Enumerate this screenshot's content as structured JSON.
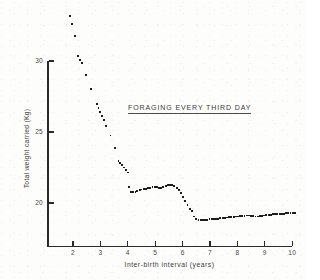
{
  "chart_data": {
    "type": "scatter",
    "title": "",
    "annotation": "FORAGING EVERY THIRD DAY",
    "xlabel": "Inter-birth interval (years)",
    "ylabel": "Total weight carried (Kg)",
    "xlim": [
      1.1,
      10.2
    ],
    "ylim": [
      16.4,
      33.9
    ],
    "xticks": [
      2,
      3,
      4,
      5,
      6,
      7,
      8,
      9,
      10
    ],
    "yticks": [
      30,
      25,
      20
    ],
    "xtick_labels": [
      "2",
      "3",
      "4",
      "5",
      "6",
      "7",
      "8",
      "9",
      "10"
    ],
    "ytick_labels": [
      "30",
      "25",
      "20"
    ],
    "grid": false,
    "legend": false,
    "marker": "square",
    "marker_color": "#1d1d1d",
    "points": [
      [
        1.88,
        33.15
      ],
      [
        1.95,
        32.6
      ],
      [
        2.06,
        31.75
      ],
      [
        2.18,
        30.35
      ],
      [
        2.26,
        30.05
      ],
      [
        2.33,
        29.85
      ],
      [
        2.48,
        29.0
      ],
      [
        2.66,
        28.05
      ],
      [
        2.86,
        26.95
      ],
      [
        2.93,
        26.7
      ],
      [
        3.0,
        26.4
      ],
      [
        3.06,
        26.1
      ],
      [
        3.13,
        25.85
      ],
      [
        3.22,
        25.45
      ],
      [
        3.37,
        24.75
      ],
      [
        3.54,
        23.85
      ],
      [
        3.66,
        22.95
      ],
      [
        3.73,
        22.8
      ],
      [
        3.8,
        22.65
      ],
      [
        3.86,
        22.5
      ],
      [
        3.93,
        22.3
      ],
      [
        4.0,
        22.15
      ],
      [
        4.06,
        21.1
      ],
      [
        4.13,
        20.8
      ],
      [
        4.2,
        20.75
      ],
      [
        4.28,
        20.8
      ],
      [
        4.35,
        20.85
      ],
      [
        4.43,
        20.9
      ],
      [
        4.5,
        20.95
      ],
      [
        4.58,
        21.0
      ],
      [
        4.66,
        21.0
      ],
      [
        4.74,
        21.05
      ],
      [
        4.82,
        21.05
      ],
      [
        4.9,
        21.1
      ],
      [
        4.98,
        21.15
      ],
      [
        5.06,
        21.1
      ],
      [
        5.14,
        21.05
      ],
      [
        5.22,
        21.05
      ],
      [
        5.3,
        21.1
      ],
      [
        5.38,
        21.2
      ],
      [
        5.46,
        21.25
      ],
      [
        5.54,
        21.25
      ],
      [
        5.62,
        21.25
      ],
      [
        5.7,
        21.2
      ],
      [
        5.78,
        21.05
      ],
      [
        5.86,
        20.9
      ],
      [
        5.94,
        20.7
      ],
      [
        6.02,
        20.45
      ],
      [
        6.1,
        20.15
      ],
      [
        6.18,
        19.85
      ],
      [
        6.26,
        19.6
      ],
      [
        6.34,
        19.45
      ],
      [
        6.42,
        19.05
      ],
      [
        6.5,
        18.85
      ],
      [
        6.58,
        18.8
      ],
      [
        6.66,
        18.78
      ],
      [
        6.74,
        18.78
      ],
      [
        6.82,
        18.8
      ],
      [
        6.9,
        18.82
      ],
      [
        6.98,
        18.85
      ],
      [
        7.06,
        18.85
      ],
      [
        7.14,
        18.88
      ],
      [
        7.22,
        18.9
      ],
      [
        7.3,
        18.9
      ],
      [
        7.38,
        18.92
      ],
      [
        7.46,
        18.95
      ],
      [
        7.54,
        18.95
      ],
      [
        7.62,
        18.98
      ],
      [
        7.7,
        19.0
      ],
      [
        7.78,
        19.0
      ],
      [
        7.86,
        19.02
      ],
      [
        7.94,
        19.05
      ],
      [
        8.02,
        19.05
      ],
      [
        8.1,
        19.08
      ],
      [
        8.18,
        19.1
      ],
      [
        8.26,
        19.1
      ],
      [
        8.34,
        19.12
      ],
      [
        8.42,
        19.12
      ],
      [
        8.5,
        19.1
      ],
      [
        8.58,
        19.08
      ],
      [
        8.66,
        19.05
      ],
      [
        8.74,
        19.05
      ],
      [
        8.82,
        19.08
      ],
      [
        8.9,
        19.1
      ],
      [
        8.98,
        19.12
      ],
      [
        9.06,
        19.15
      ],
      [
        9.14,
        19.15
      ],
      [
        9.22,
        19.18
      ],
      [
        9.3,
        19.2
      ],
      [
        9.38,
        19.2
      ],
      [
        9.46,
        19.22
      ],
      [
        9.54,
        19.25
      ],
      [
        9.62,
        19.25
      ],
      [
        9.7,
        19.25
      ],
      [
        9.78,
        19.28
      ],
      [
        9.86,
        19.3
      ],
      [
        9.94,
        19.3
      ],
      [
        10.02,
        19.32
      ],
      [
        10.1,
        19.32
      ]
    ]
  }
}
